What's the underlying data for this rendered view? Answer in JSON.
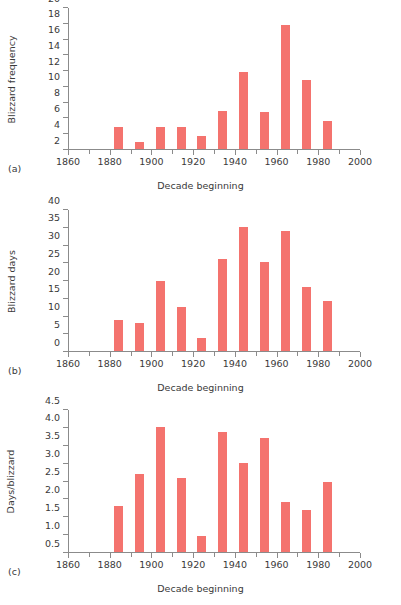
{
  "figure": {
    "panel_count": 3,
    "bar_color": "#f4736e",
    "axis_color": "#8b8b8b",
    "text_color": "#3a3a3a",
    "background": "#ffffff"
  },
  "panels": [
    {
      "letter": "(a)",
      "ylabel": "Blizzard frequency",
      "xlabel": "Decade beginning"
    },
    {
      "letter": "(b)",
      "ylabel": "Blizzard days",
      "xlabel": "Decade beginning"
    },
    {
      "letter": "(c)",
      "ylabel": "Days/blizzard",
      "xlabel": "Decade beginning"
    }
  ],
  "chart_data": [
    {
      "type": "bar",
      "panel": "(a)",
      "title": "",
      "xlabel": "Decade beginning",
      "ylabel": "Blizzard frequency",
      "grid": false,
      "legend": "none",
      "xlim": [
        1860,
        2000
      ],
      "ylim": [
        2,
        20
      ],
      "ybase": 2,
      "yticks": [
        2,
        4,
        6,
        8,
        10,
        12,
        14,
        16,
        18,
        20
      ],
      "ytick_labels": [
        "2",
        "4",
        "6",
        "8",
        "10",
        "12",
        "14",
        "16",
        "18",
        "20"
      ],
      "xticks_major": [
        1860,
        1880,
        1900,
        1920,
        1940,
        1960,
        1980,
        2000
      ],
      "xtick_labels": [
        "1860",
        "1880",
        "1900",
        "1920",
        "1940",
        "1960",
        "1980",
        "2000"
      ],
      "xticks_minor": [
        1870,
        1890,
        1910,
        1930,
        1950,
        1970,
        1990
      ],
      "categories": [
        1880,
        1890,
        1900,
        1910,
        1920,
        1930,
        1940,
        1950,
        1960,
        1970,
        1980
      ],
      "values": [
        4.8,
        2.9,
        4.8,
        4.8,
        3.7,
        6.8,
        11.8,
        6.7,
        17.7,
        10.7,
        5.6
      ]
    },
    {
      "type": "bar",
      "panel": "(b)",
      "title": "",
      "xlabel": "Decade beginning",
      "ylabel": "Blizzard days",
      "grid": false,
      "legend": "none",
      "xlim": [
        1860,
        2000
      ],
      "ylim": [
        0,
        40
      ],
      "ybase": 0,
      "yticks": [
        0,
        5,
        10,
        15,
        20,
        25,
        30,
        35,
        40
      ],
      "ytick_labels": [
        "0",
        "5",
        "10",
        "15",
        "20",
        "25",
        "30",
        "35",
        "40"
      ],
      "xticks_major": [
        1860,
        1880,
        1900,
        1920,
        1940,
        1960,
        1980,
        2000
      ],
      "xtick_labels": [
        "1860",
        "1880",
        "1900",
        "1920",
        "1940",
        "1960",
        "1980",
        "2000"
      ],
      "xticks_minor": [
        1870,
        1890,
        1910,
        1930,
        1950,
        1970,
        1990
      ],
      "categories": [
        1880,
        1890,
        1900,
        1910,
        1920,
        1930,
        1940,
        1950,
        1960,
        1970,
        1980
      ],
      "values": [
        8.7,
        8.0,
        19.7,
        12.5,
        3.6,
        26.0,
        34.9,
        25.0,
        33.8,
        18.1,
        14.1
      ]
    },
    {
      "type": "bar",
      "panel": "(c)",
      "title": "",
      "xlabel": "Decade beginning",
      "ylabel": "Days/blizzard",
      "grid": false,
      "legend": "none",
      "xlim": [
        1860,
        2000
      ],
      "ylim": [
        0.5,
        4.5
      ],
      "ybase": 0.5,
      "yticks": [
        0.5,
        1.0,
        1.5,
        2.0,
        2.5,
        3.0,
        3.5,
        4.0,
        4.5
      ],
      "ytick_labels": [
        "0.5",
        "1.0",
        "1.5",
        "2.0",
        "2.5",
        "3.0",
        "3.5",
        "4.0",
        "4.5"
      ],
      "xticks_major": [
        1860,
        1880,
        1900,
        1920,
        1940,
        1960,
        1980,
        2000
      ],
      "xtick_labels": [
        "1860",
        "1880",
        "1900",
        "1920",
        "1940",
        "1960",
        "1980",
        "2000"
      ],
      "xticks_minor": [
        1870,
        1890,
        1910,
        1930,
        1950,
        1970,
        1990
      ],
      "categories": [
        1880,
        1890,
        1900,
        1910,
        1920,
        1930,
        1940,
        1950,
        1960,
        1970,
        1980
      ],
      "values": [
        1.79,
        2.67,
        4.01,
        2.58,
        0.96,
        3.86,
        2.98,
        3.68,
        1.9,
        1.68,
        2.46
      ]
    }
  ]
}
